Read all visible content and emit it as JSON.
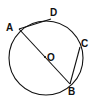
{
  "diagram": {
    "type": "circle-geometry",
    "circle": {
      "center_label": "O",
      "cx": 46,
      "cy": 58,
      "r": 37
    },
    "points": {
      "A": {
        "label": "A",
        "x": 19,
        "y": 29,
        "label_x": 6,
        "label_y": 31
      },
      "D": {
        "label": "D",
        "x": 51,
        "y": 19,
        "label_x": 50,
        "label_y": 16
      },
      "C": {
        "label": "C",
        "x": 80,
        "y": 47,
        "label_x": 81,
        "label_y": 47
      },
      "B": {
        "label": "B",
        "x": 70,
        "y": 84,
        "label_x": 68,
        "label_y": 95
      },
      "O": {
        "label": "O",
        "x": 45,
        "y": 57,
        "label_x": 47,
        "label_y": 61
      }
    },
    "segments": [
      "AB",
      "AD",
      "BC"
    ],
    "stroke_color": "#111111"
  }
}
